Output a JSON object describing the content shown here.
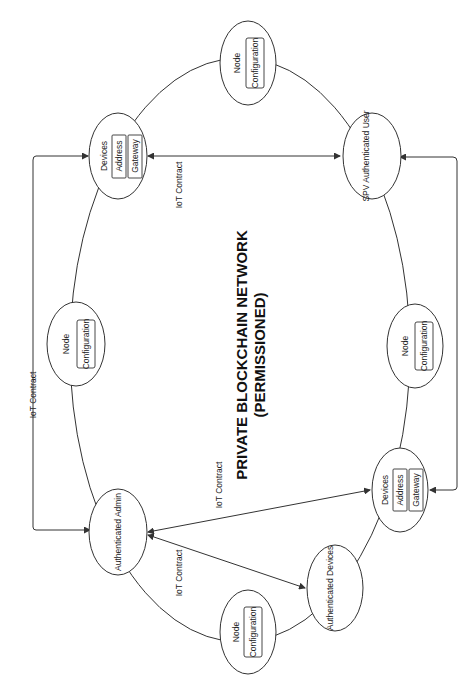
{
  "diagram": {
    "title_line1": "PRIVATE BLOCKCHAIN NETWORK",
    "title_line2": "(PERMISSIONED)",
    "orientation": "rotated 90° counter-clockwise",
    "nodes": [
      {
        "id": "node_top",
        "label": "Node",
        "sub": [
          "Configuration"
        ]
      },
      {
        "id": "devices_top",
        "label": "Devices",
        "sub": [
          "Address",
          "Gateway"
        ]
      },
      {
        "id": "spv_user",
        "label": "SPV Authenticated User"
      },
      {
        "id": "node_left",
        "label": "Node",
        "sub": [
          "Configuration"
        ]
      },
      {
        "id": "node_right",
        "label": "Node",
        "sub": [
          "Configuration"
        ]
      },
      {
        "id": "auth_admin",
        "label": "Authenticated Admin"
      },
      {
        "id": "devices_bottom",
        "label": "Devices",
        "sub": [
          "Address",
          "Gateway"
        ]
      },
      {
        "id": "auth_devices",
        "label": "Authenticated Devices"
      },
      {
        "id": "node_bottom",
        "label": "Node",
        "sub": [
          "Configuration"
        ]
      }
    ],
    "edges": [
      {
        "from": "devices_top",
        "to": "spv_user",
        "label": "IoT Contract",
        "bidirectional": true
      },
      {
        "from": "auth_admin",
        "to": "devices_top",
        "label": "IoT Contract",
        "bidirectional": true
      },
      {
        "from": "auth_admin",
        "to": "devices_bottom",
        "label": "IoT Contract",
        "bidirectional": true
      },
      {
        "from": "auth_admin",
        "to": "auth_devices",
        "label": "IoT Contract",
        "bidirectional": true
      },
      {
        "from": "spv_user",
        "to": "devices_bottom",
        "label": "",
        "bidirectional": true
      }
    ],
    "edge_label": "IoT Contract"
  }
}
